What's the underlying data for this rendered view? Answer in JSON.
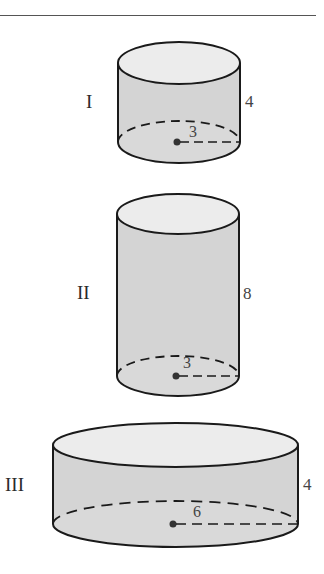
{
  "figure": {
    "colors": {
      "side_fill": "#d4d4d4",
      "top_fill": "#ececec",
      "bottom_fill": "#d9d9d9",
      "stroke": "#1a1a1a"
    },
    "cylinders": [
      {
        "label": "I",
        "height": "4",
        "radius": "3"
      },
      {
        "label": "II",
        "height": "8",
        "radius": "3"
      },
      {
        "label": "III",
        "height": "4",
        "radius": "6"
      }
    ]
  }
}
